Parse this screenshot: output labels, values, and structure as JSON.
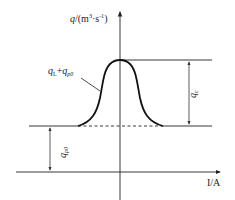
{
  "diagram": {
    "y_axis_label": {
      "var": "q",
      "unit_open": "/(m",
      "unit_sup": "3",
      "unit_mid": "·s",
      "unit_sup2": "-1",
      "unit_close": ")"
    },
    "x_axis_label": "I/A",
    "curve_label": {
      "a": "q",
      "a_sub": "L",
      "plus": "+",
      "b": "q",
      "b_sub": "p0"
    },
    "dim_top_label": {
      "var": "q",
      "sub": "c"
    },
    "dim_bottom_label": {
      "var": "q",
      "sub": "p0"
    },
    "colors": {
      "line": "#1a1a1a",
      "thin": "#333333"
    }
  }
}
